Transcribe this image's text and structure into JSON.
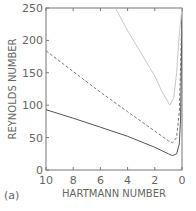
{
  "chart_data": {
    "type": "line",
    "panel_label": "(a)",
    "title": "",
    "xlabel": "HARTMANN NUMBER",
    "ylabel": "REYNOLDS NUMBER",
    "xlim": [
      10,
      0
    ],
    "ylim": [
      0,
      250
    ],
    "x_ticks": [
      10,
      8,
      6,
      4,
      2,
      0
    ],
    "y_ticks": [
      0,
      50,
      100,
      150,
      200,
      250
    ],
    "grid": false,
    "legend": null,
    "series": [
      {
        "name": "solid",
        "style": "solid",
        "color": "#555555",
        "x": [
          10,
          8,
          6,
          4,
          2,
          1,
          0.7,
          0.4,
          0.2,
          0.1,
          0
        ],
        "y": [
          93,
          80,
          66,
          52,
          35,
          25,
          22,
          25,
          40,
          80,
          250
        ]
      },
      {
        "name": "dashed",
        "style": "dashed",
        "color": "#777777",
        "x": [
          10,
          8,
          6,
          4,
          2,
          1,
          0.7,
          0.4,
          0.2,
          0.1,
          0
        ],
        "y": [
          184,
          152,
          120,
          90,
          60,
          45,
          42,
          50,
          90,
          160,
          250
        ]
      },
      {
        "name": "light",
        "style": "solid-light",
        "color": "#c8c8c8",
        "x": [
          4.9,
          4,
          3,
          2,
          1.5,
          1,
          0.9,
          0.6,
          0.4,
          0.2,
          0
        ],
        "y": [
          250,
          215,
          180,
          145,
          122,
          104,
          100,
          112,
          150,
          210,
          250
        ]
      }
    ]
  }
}
